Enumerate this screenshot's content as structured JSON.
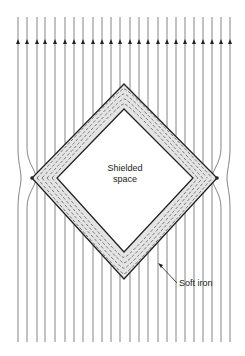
{
  "diagram": {
    "labels": {
      "shielded_line1": "Shielded",
      "shielded_line2": "space",
      "soft_iron": "Soft iron"
    },
    "field_lines": {
      "count": 24,
      "direction": "up",
      "x_positions": [
        18,
        27,
        37,
        45,
        55,
        65,
        74,
        83,
        93,
        102,
        111,
        120,
        130,
        139,
        148,
        158,
        167,
        176,
        185,
        194,
        203,
        212,
        221,
        230
      ],
      "y_top": 17,
      "y_bottom": 342,
      "arrow_y": 43
    },
    "shield": {
      "outer": {
        "top": [
          124,
          84
        ],
        "right": [
          217,
          178
        ],
        "bottom": [
          124,
          279
        ],
        "left": [
          32,
          178
        ]
      },
      "inner": {
        "top": [
          124,
          109
        ],
        "right": [
          193,
          178
        ],
        "bottom": [
          124,
          252
        ],
        "left": [
          57,
          178
        ]
      }
    },
    "colors": {
      "line": "#555555",
      "outline": "#222222",
      "background": "#ffffff"
    }
  }
}
